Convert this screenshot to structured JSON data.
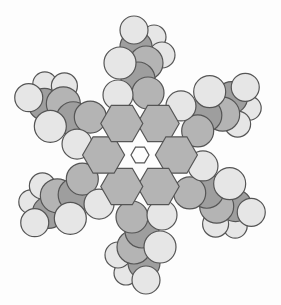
{
  "diagram": {
    "type": "space-filling molecular model",
    "colors": {
      "background": "#fdfdfd",
      "carbon": "#b4b4b4",
      "carbon_dark": "#9e9e9e",
      "hydrogen": "#e6e6e6",
      "outline": "#555555"
    },
    "center": [
      140,
      155
    ],
    "arms": 6
  }
}
